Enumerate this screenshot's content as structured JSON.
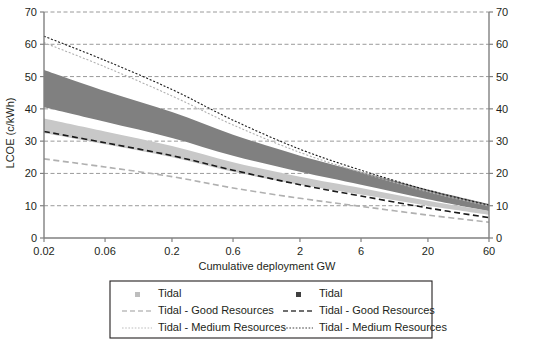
{
  "chart_data": {
    "type": "area",
    "title": "",
    "xlabel": "Cumulative deployment GW",
    "ylabel": "LCOE (c/kWh)",
    "xscale": "log",
    "xlim": [
      0.02,
      60
    ],
    "ylim": [
      0,
      70
    ],
    "grid": true,
    "xticks": [
      "0.02",
      "0.06",
      "0.2",
      "0.6",
      "2",
      "6",
      "20",
      "60"
    ],
    "xtick_values": [
      0.02,
      0.06,
      0.2,
      0.6,
      2,
      6,
      20,
      60
    ],
    "yticks": [
      "0",
      "10",
      "20",
      "30",
      "40",
      "50",
      "60",
      "70"
    ],
    "ytick_values": [
      0,
      10,
      20,
      30,
      40,
      50,
      60,
      70
    ],
    "right_yticks": [
      "0",
      "10",
      "20",
      "30",
      "40",
      "50",
      "60",
      "70"
    ],
    "legend_position": "bottom",
    "colors": {
      "band_dark": "#808080",
      "band_light": "#c8c8c8",
      "line_dark": "#1a1a1a",
      "line_light": "#b0b0b0",
      "grid": "#808080",
      "axis": "#808080",
      "background": "#ffffff"
    },
    "series": [
      {
        "name": "Tidal",
        "style": "band",
        "color": "#808080",
        "x": [
          0.02,
          0.06,
          0.2,
          0.6,
          2,
          6,
          20,
          60
        ],
        "upper": [
          52.0,
          45.5,
          39.0,
          32.0,
          25.5,
          20.5,
          15.0,
          10.5
        ],
        "lower": [
          40.5,
          36.0,
          31.0,
          25.5,
          20.5,
          16.5,
          12.0,
          8.3
        ]
      },
      {
        "name": "Tidal",
        "style": "band",
        "color": "#c8c8c8",
        "x": [
          0.02,
          0.06,
          0.2,
          0.6,
          2,
          6,
          20,
          60
        ],
        "upper": [
          37.0,
          33.0,
          28.5,
          23.5,
          19.0,
          15.5,
          11.5,
          8.4
        ],
        "lower": [
          32.5,
          29.0,
          25.0,
          20.5,
          16.5,
          13.5,
          10.0,
          7.2
        ]
      },
      {
        "name": "Tidal - Good Resources",
        "style": "dashed",
        "color": "#1a1a1a",
        "x": [
          0.02,
          0.06,
          0.2,
          0.6,
          2,
          6,
          20,
          60
        ],
        "y": [
          33.0,
          29.5,
          25.5,
          21.0,
          16.5,
          13.0,
          9.3,
          6.3
        ]
      },
      {
        "name": "Tidal - Good Resources",
        "style": "dashed",
        "color": "#b0b0b0",
        "x": [
          0.02,
          0.06,
          0.2,
          0.6,
          2,
          6,
          20,
          60
        ],
        "y": [
          24.5,
          22.0,
          19.0,
          15.5,
          12.3,
          9.8,
          7.1,
          4.9
        ]
      },
      {
        "name": "Tidal - Medium Resources",
        "style": "dotted",
        "color": "#1a1a1a",
        "x": [
          0.02,
          0.06,
          0.2,
          0.6,
          2,
          6,
          20,
          60
        ],
        "y": [
          62.5,
          55.0,
          46.0,
          36.5,
          27.5,
          21.0,
          14.8,
          10.2
        ]
      },
      {
        "name": "Tidal - Medium Resources",
        "style": "dotted",
        "color": "#b0b0b0",
        "x": [
          0.02,
          0.06,
          0.2,
          0.6,
          2,
          6,
          20,
          60
        ],
        "y": [
          60.5,
          53.0,
          44.0,
          35.0,
          26.5,
          20.3,
          14.3,
          9.9
        ]
      }
    ],
    "legend": {
      "columns": [
        {
          "color": "#bdbdbd",
          "entries": [
            {
              "label": "Tidal",
              "marker": "square"
            },
            {
              "label": "Tidal - Good Resources",
              "marker": "dashed"
            },
            {
              "label": "Tidal - Medium Resources",
              "marker": "dotted"
            }
          ]
        },
        {
          "color": "#404040",
          "entries": [
            {
              "label": "Tidal",
              "marker": "square"
            },
            {
              "label": "Tidal - Good Resources",
              "marker": "dashed"
            },
            {
              "label": "Tidal - Medium Resources",
              "marker": "dotted"
            }
          ]
        }
      ]
    }
  }
}
